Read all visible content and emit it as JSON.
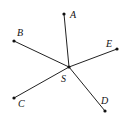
{
  "diagram": {
    "center": {
      "id": "S",
      "label": "S",
      "x": 69,
      "y": 67,
      "label_x": 61,
      "label_y": 82
    },
    "points": [
      {
        "id": "A",
        "label": "A",
        "x": 64,
        "y": 14,
        "label_x": 70,
        "label_y": 18
      },
      {
        "id": "B",
        "label": "B",
        "x": 14,
        "y": 41,
        "label_x": 17,
        "label_y": 36
      },
      {
        "id": "E",
        "label": "E",
        "x": 117,
        "y": 49,
        "label_x": 106,
        "label_y": 47
      },
      {
        "id": "C",
        "label": "C",
        "x": 14,
        "y": 98,
        "label_x": 18,
        "label_y": 107
      },
      {
        "id": "D",
        "label": "D",
        "x": 105,
        "y": 111,
        "label_x": 101,
        "label_y": 104
      }
    ],
    "segments": [
      "SA",
      "SB",
      "SC",
      "SD",
      "SE"
    ],
    "colors": {
      "line": "#222222",
      "point": "#111111"
    }
  }
}
